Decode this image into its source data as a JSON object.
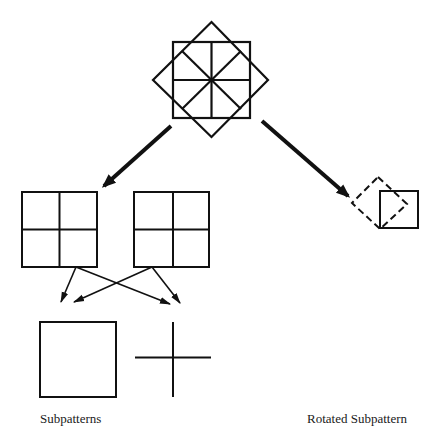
{
  "diagram": {
    "type": "pattern-decomposition",
    "stroke_color": "#111111",
    "labels": {
      "subpatterns": "Subpatterns",
      "rotated_subpattern": "Rotated Subpattern"
    },
    "nodes": [
      {
        "id": "composite-pattern",
        "description": "Square 2x2 grid overlaid with rotated diamond divided by diagonals"
      },
      {
        "id": "grid-left",
        "description": "2x2 grid square"
      },
      {
        "id": "grid-middle",
        "description": "2x2 grid square"
      },
      {
        "id": "subpattern-square",
        "description": "Plain square"
      },
      {
        "id": "subpattern-cross",
        "description": "Plus/cross shape"
      },
      {
        "id": "rotated-subpattern",
        "description": "Dashed 45-degree rotated square overlapping solid square"
      }
    ],
    "edges": [
      {
        "from": "composite-pattern",
        "to": "grid-left",
        "style": "thick"
      },
      {
        "from": "composite-pattern",
        "to": "rotated-subpattern",
        "style": "thick"
      },
      {
        "from": "grid-left",
        "to": "subpattern-square",
        "style": "thin"
      },
      {
        "from": "grid-left",
        "to": "subpattern-cross",
        "style": "thin"
      },
      {
        "from": "grid-middle",
        "to": "subpattern-square",
        "style": "thin"
      },
      {
        "from": "grid-middle",
        "to": "subpattern-cross",
        "style": "thin"
      }
    ]
  }
}
